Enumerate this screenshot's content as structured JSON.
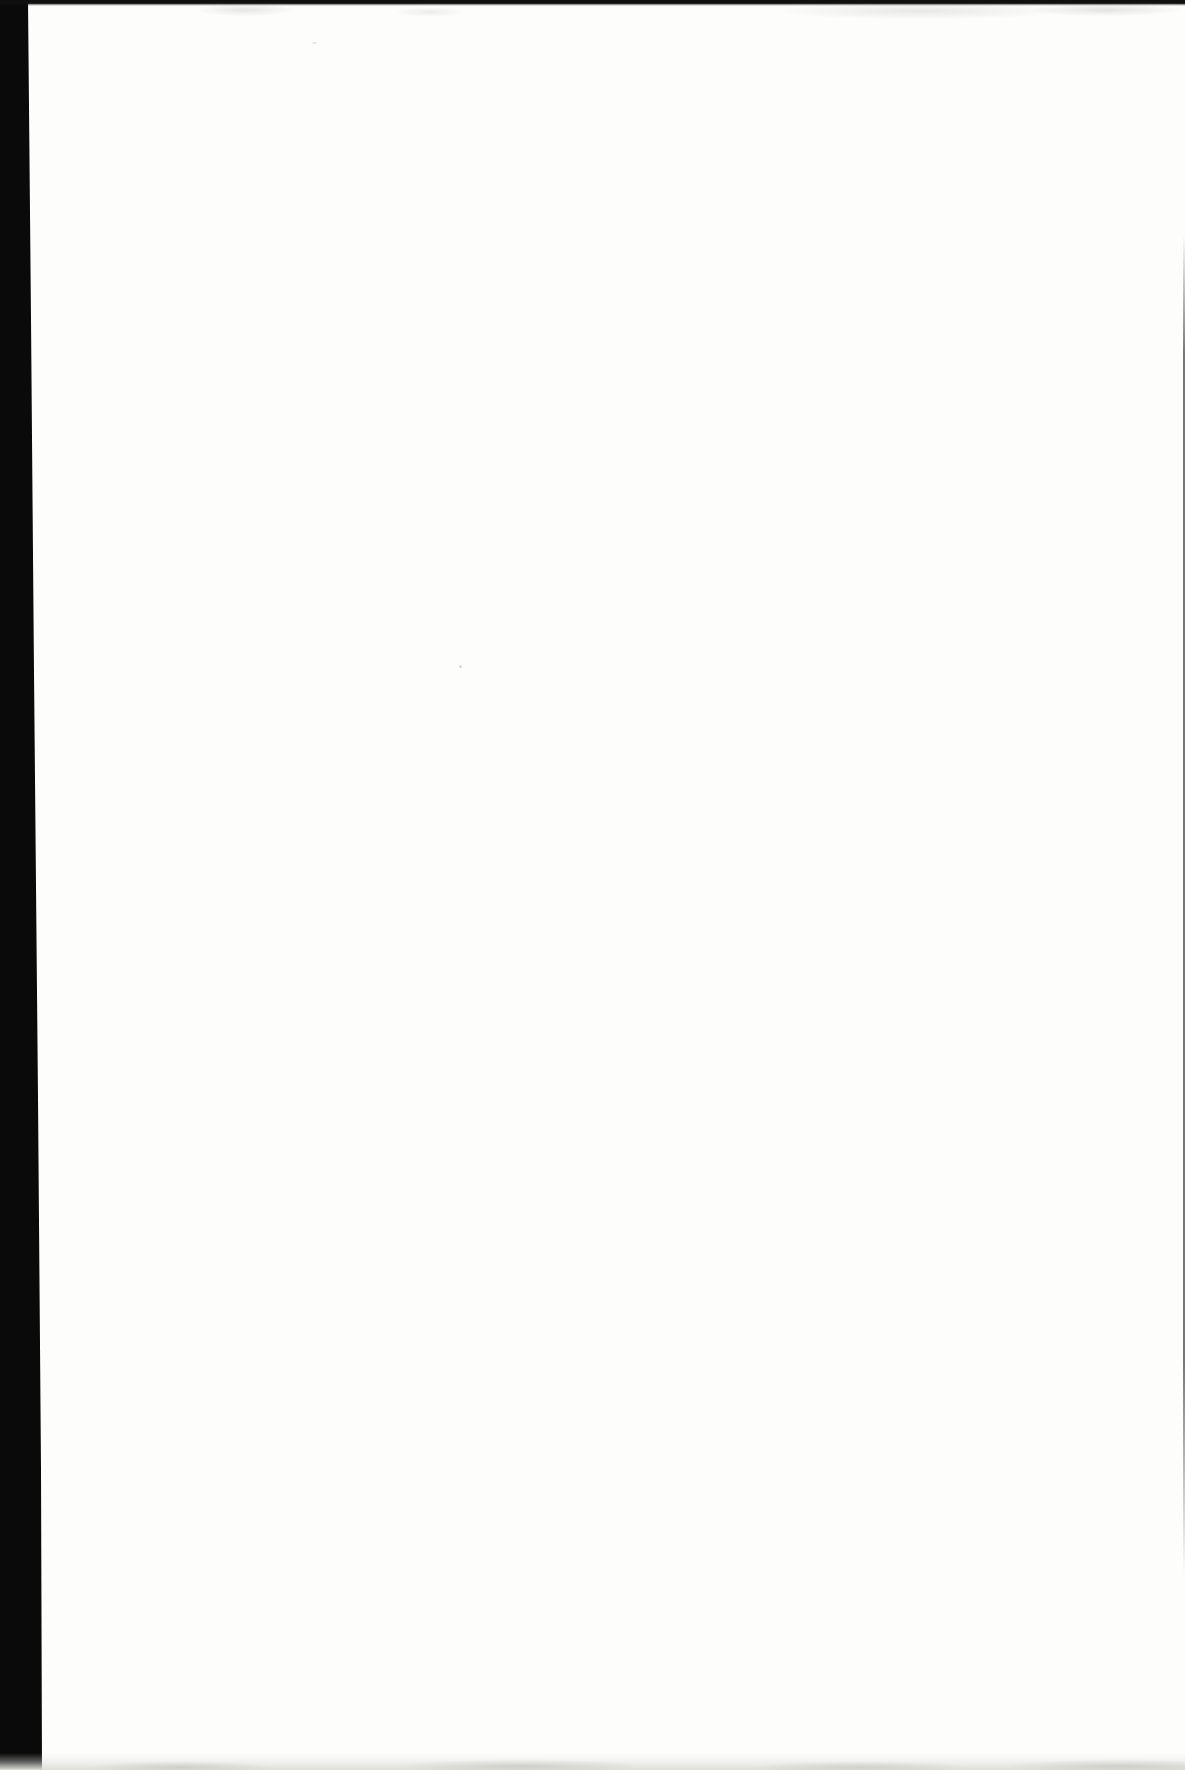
{
  "colors": {
    "paper": "#fdfdfc",
    "gutter_bar": "#0a0a0a",
    "top_edge": "#101010",
    "right_edge": "#4a4a4a",
    "bottom_tint": "#dededa",
    "speck": "#b9b9b9"
  },
  "page": {
    "visible_text": ""
  }
}
